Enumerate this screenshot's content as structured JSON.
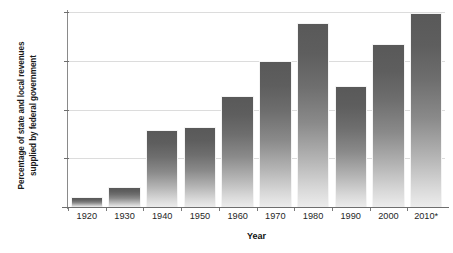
{
  "chart_data": {
    "type": "bar",
    "title": "",
    "xlabel": "Year",
    "ylabel": "Percentage of state and local revenues supplied by federal government",
    "ylabel_lines": [
      "Percentage of state and local revenues",
      "supplied by federal government"
    ],
    "categories": [
      "1920",
      "1930",
      "1940",
      "1950",
      "1960",
      "1970",
      "1980",
      "1990",
      "2000",
      "2010*"
    ],
    "values": [
      1.0,
      2.1,
      7.9,
      8.2,
      11.4,
      15.0,
      18.9,
      12.4,
      16.7,
      19.9
    ],
    "ylim": [
      0,
      20
    ],
    "yticks": [
      0,
      5,
      10,
      15,
      20
    ],
    "ytick_labels": [
      "0",
      "5",
      "10",
      "15",
      "20%"
    ],
    "grid": true,
    "legend": null,
    "bar_color_top": "#595959",
    "bar_color_bottom": "#ececec",
    "gridline_color": "#dcdcdc",
    "axis_color": "#6e6e6e",
    "footnote_marker": "*"
  }
}
